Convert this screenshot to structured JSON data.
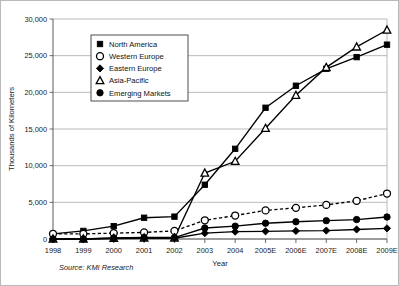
{
  "chart_data": {
    "type": "line",
    "title": "",
    "xlabel": "Year",
    "ylabel": "Thousands of Kilometers",
    "categories": [
      "1998",
      "1999",
      "2000",
      "2001",
      "2002",
      "2003",
      "2004",
      "2005E",
      "2006E",
      "2007E",
      "2008E",
      "2009E"
    ],
    "ylim": [
      0,
      30000
    ],
    "ytick_values": [
      0,
      5000,
      10000,
      15000,
      20000,
      25000,
      30000
    ],
    "ytick_labels": [
      "0",
      "5,000",
      "10,000",
      "15,000",
      "20,000",
      "25,000",
      "30,000"
    ],
    "grid": true,
    "legend_position": "upper-left-inside",
    "source": "Source: KMI Research",
    "series": [
      {
        "name": "North America",
        "marker": "square-filled",
        "line_style": "solid",
        "color": "#000000",
        "values": [
          700,
          1100,
          1750,
          2900,
          3050,
          7400,
          12300,
          17900,
          20900,
          23200,
          24800,
          26500
        ]
      },
      {
        "name": "Western Europe",
        "marker": "circle-open",
        "line_style": "dashed",
        "color": "#000000",
        "values": [
          700,
          700,
          800,
          900,
          1100,
          2550,
          3200,
          3900,
          4250,
          4650,
          5200,
          6200
        ]
      },
      {
        "name": "Eastern Europe",
        "marker": "diamond-filled",
        "line_style": "solid",
        "color": "#000000",
        "values": [
          0,
          0,
          50,
          100,
          100,
          800,
          1000,
          1050,
          1100,
          1150,
          1300,
          1450
        ]
      },
      {
        "name": "Asia-Pacific",
        "marker": "triangle-open",
        "line_style": "solid",
        "color": "#000000",
        "values": [
          0,
          0,
          100,
          150,
          150,
          9000,
          10600,
          15100,
          19600,
          23400,
          26200,
          28500
        ]
      },
      {
        "name": "Emerging Markets",
        "marker": "circle-filled",
        "line_style": "solid",
        "color": "#000000",
        "values": [
          0,
          0,
          150,
          200,
          200,
          1500,
          1750,
          2150,
          2350,
          2500,
          2650,
          3000
        ]
      }
    ]
  }
}
